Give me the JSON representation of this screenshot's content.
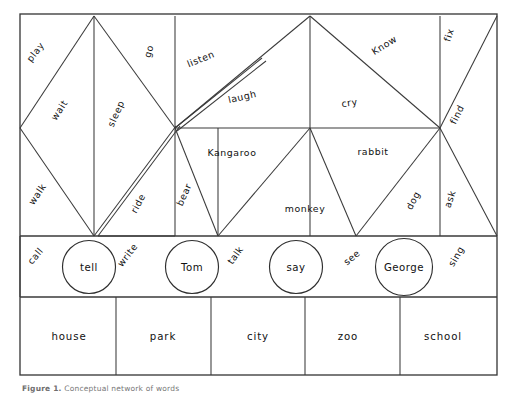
{
  "figure": {
    "caption_prefix": "Figure 1.",
    "caption_text": "Conceptual network of words",
    "background": "#ffffff",
    "line_color": "#3a3a3a"
  },
  "frame": {
    "x": 20,
    "y": 14,
    "width": 477,
    "height": 361
  },
  "rows": {
    "verbs_top": {
      "y_top": 14,
      "y_bottom": 236
    },
    "names_row": {
      "y_top": 236,
      "y_bottom": 297
    },
    "places_row": {
      "y_top": 297,
      "y_bottom": 375
    }
  },
  "nodes": [
    {
      "name": "tell",
      "cx": 89,
      "cy": 267,
      "r": 26.5
    },
    {
      "name": "Tom",
      "cx": 192,
      "cy": 267,
      "r": 26.5
    },
    {
      "name": "say",
      "cx": 296,
      "cy": 267,
      "r": 26.5
    },
    {
      "name": "George",
      "cx": 404,
      "cy": 267,
      "r": 28.5
    }
  ],
  "places": [
    {
      "label": "house",
      "cx": 69
    },
    {
      "label": "park",
      "cx": 163
    },
    {
      "label": "city",
      "cx": 258
    },
    {
      "label": "zoo",
      "cx": 348
    },
    {
      "label": "school",
      "cx": 443
    }
  ],
  "place_dividers": [
    116,
    211,
    305,
    400
  ],
  "edge_labels": [
    {
      "text": "play",
      "x": 38,
      "y": 54,
      "rot": -52
    },
    {
      "text": "wait",
      "x": 62,
      "y": 112,
      "rot": -57
    },
    {
      "text": "walk",
      "x": 40,
      "y": 196,
      "rot": -56
    },
    {
      "text": "go",
      "x": 152,
      "y": 52,
      "rot": -75
    },
    {
      "text": "sleep",
      "x": 119,
      "y": 115,
      "rot": -66
    },
    {
      "text": "ride",
      "x": 141,
      "y": 205,
      "rot": -62
    },
    {
      "text": "listen",
      "x": 202,
      "y": 62,
      "rot": -22
    },
    {
      "text": "laugh",
      "x": 243,
      "y": 100,
      "rot": -13
    },
    {
      "text": "Kangaroo",
      "x": 232,
      "y": 156,
      "rot": 0
    },
    {
      "text": "bear",
      "x": 187,
      "y": 196,
      "rot": -66
    },
    {
      "text": "monkey",
      "x": 305,
      "y": 212,
      "rot": 0
    },
    {
      "text": "cry",
      "x": 350,
      "y": 106,
      "rot": -8
    },
    {
      "text": "Know",
      "x": 386,
      "y": 48,
      "rot": -32
    },
    {
      "text": "rabbit",
      "x": 373,
      "y": 155,
      "rot": 0
    },
    {
      "text": "fix",
      "x": 452,
      "y": 36,
      "rot": -73
    },
    {
      "text": "find",
      "x": 460,
      "y": 116,
      "rot": -64
    },
    {
      "text": "dog",
      "x": 416,
      "y": 202,
      "rot": -62
    },
    {
      "text": "ask",
      "x": 453,
      "y": 200,
      "rot": -72
    },
    {
      "text": "call",
      "x": 38,
      "y": 258,
      "rot": -50
    },
    {
      "text": "write",
      "x": 130,
      "y": 257,
      "rot": -52
    },
    {
      "text": "talk",
      "x": 238,
      "y": 257,
      "rot": -54
    },
    {
      "text": "see",
      "x": 354,
      "y": 260,
      "rot": -40
    },
    {
      "text": "sing",
      "x": 459,
      "y": 258,
      "rot": -60
    }
  ],
  "geometry": {
    "apex_left": {
      "x": 94,
      "y": 16
    },
    "apex_right": {
      "x": 310,
      "y": 16
    },
    "hub_mid": {
      "x": 175,
      "y": 128
    },
    "hub_right": {
      "x": 440,
      "y": 128
    },
    "left_vertex": {
      "x": 20,
      "y": 128
    },
    "bottom_left_hub": {
      "x": 94,
      "y": 236
    },
    "bottom_mid_hub": {
      "x": 218,
      "y": 236
    },
    "bottom_right_hub": {
      "x": 356,
      "y": 236
    },
    "top_right_corner": {
      "x": 497,
      "y": 16
    },
    "right_vertex": {
      "x": 497,
      "y": 236
    },
    "vertical_columns": [
      94,
      175,
      218,
      310,
      356,
      440
    ],
    "horizontal_mid_line": {
      "x1": 175,
      "x2": 440,
      "y": 128
    }
  }
}
